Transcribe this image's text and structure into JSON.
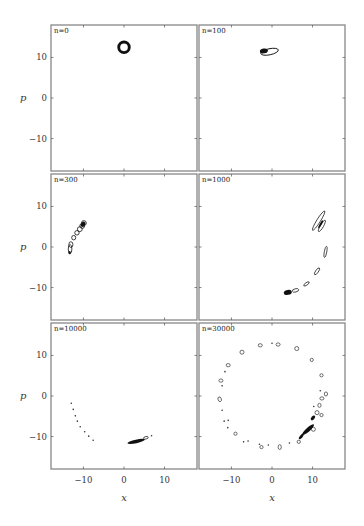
{
  "chart_data": {
    "type": "scatter",
    "layout": "3x2 grid of phase-space panels",
    "xlabel": "x",
    "ylabel": "p",
    "xlim": [
      -18,
      18
    ],
    "ylim": [
      -18,
      18
    ],
    "xticks": [
      -10,
      0,
      10
    ],
    "yticks": [
      10,
      0,
      -10
    ],
    "xtick_labels": [
      "−10",
      "0",
      "10"
    ],
    "ytick_labels": [
      "10",
      "0",
      "−10"
    ],
    "grid": false,
    "legend": null,
    "panels": [
      {
        "label": "n = 0",
        "label_text": "n=0",
        "description": "single compact ring (annulus) centered near x=0, p=12.5",
        "rings": [
          {
            "x": 0,
            "p": 12.5,
            "rx": 1.3,
            "ry": 1.3,
            "angle": 0,
            "filled": false,
            "stroke": 1.1
          }
        ],
        "blobs": [],
        "dots": []
      },
      {
        "label": "n = 100",
        "label_text": "n=100",
        "description": "stretched dark contour blob near x=-1, p=11.5",
        "rings": [
          {
            "x": -0.6,
            "p": 11.4,
            "rx": 2.2,
            "ry": 0.75,
            "angle": 12,
            "filled": false,
            "stroke": 0.9
          }
        ],
        "blobs": [
          {
            "x": -2.0,
            "p": 11.6,
            "rx": 1.0,
            "ry": 0.6,
            "angle": 10
          }
        ],
        "dots": []
      },
      {
        "label": "n = 300",
        "label_text": "n=300",
        "description": "chain of small contour islands along an arc from (-13,-1) to (-9.5,6)",
        "rings": [
          {
            "x": -13.3,
            "p": -0.5,
            "rx": 0.45,
            "ry": 1.1,
            "angle": 0,
            "filled": false,
            "stroke": 0.8
          },
          {
            "x": -13.1,
            "p": 0.6,
            "rx": 0.5,
            "ry": 0.7,
            "angle": 0,
            "filled": false,
            "stroke": 0.8
          },
          {
            "x": -12.4,
            "p": 2.3,
            "rx": 0.5,
            "ry": 0.55,
            "angle": 0,
            "filled": false,
            "stroke": 0.8
          },
          {
            "x": -11.6,
            "p": 3.5,
            "rx": 0.55,
            "ry": 0.55,
            "angle": 0,
            "filled": false,
            "stroke": 0.8
          },
          {
            "x": -10.9,
            "p": 4.4,
            "rx": 0.6,
            "ry": 0.6,
            "angle": 0,
            "filled": false,
            "stroke": 0.8
          },
          {
            "x": -10.3,
            "p": 5.2,
            "rx": 0.6,
            "ry": 0.6,
            "angle": 0,
            "filled": false,
            "stroke": 0.8
          },
          {
            "x": -9.9,
            "p": 5.9,
            "rx": 0.6,
            "ry": 0.6,
            "angle": 0,
            "filled": false,
            "stroke": 0.8
          }
        ],
        "blobs": [
          {
            "x": -13.4,
            "p": -1.4,
            "rx": 0.3,
            "ry": 0.4,
            "angle": 0
          },
          {
            "x": -10.1,
            "p": 5.6,
            "rx": 0.5,
            "ry": 0.7,
            "angle": -35
          }
        ],
        "dots": []
      },
      {
        "label": "n = 1000",
        "label_text": "n=1000",
        "description": "elongated filaments along a circular arc of radius ~13, clustered dense blob near (4,-11)",
        "rings": [
          {
            "x": 11.5,
            "p": 6.5,
            "rx": 2.8,
            "ry": 0.45,
            "angle": 58,
            "filled": false,
            "stroke": 0.7
          },
          {
            "x": 12.3,
            "p": 5.2,
            "rx": 1.6,
            "ry": 0.4,
            "angle": 60,
            "filled": false,
            "stroke": 0.7
          },
          {
            "x": 13.2,
            "p": -1.2,
            "rx": 1.4,
            "ry": 0.3,
            "angle": 80,
            "filled": false,
            "stroke": 0.7
          },
          {
            "x": 11.1,
            "p": -6.0,
            "rx": 1.0,
            "ry": 0.35,
            "angle": 55,
            "filled": false,
            "stroke": 0.7
          },
          {
            "x": 8.5,
            "p": -9.1,
            "rx": 0.8,
            "ry": 0.3,
            "angle": 35,
            "filled": false,
            "stroke": 0.7
          },
          {
            "x": 5.8,
            "p": -10.7,
            "rx": 0.8,
            "ry": 0.4,
            "angle": 15,
            "filled": false,
            "stroke": 0.7
          }
        ],
        "blobs": [
          {
            "x": 3.9,
            "p": -11.2,
            "rx": 1.0,
            "ry": 0.6,
            "angle": 10
          },
          {
            "x": 12.0,
            "p": 5.6,
            "rx": 1.1,
            "ry": 0.25,
            "angle": 60
          }
        ],
        "dots": []
      },
      {
        "label": "n = 10000",
        "label_text": "n=10000",
        "description": "trail of tiny dots along arc on left, dense streak near (3,-11)",
        "rings": [
          {
            "x": 5.4,
            "p": -10.3,
            "rx": 0.6,
            "ry": 0.3,
            "angle": 15,
            "filled": false,
            "stroke": 0.7
          }
        ],
        "blobs": [
          {
            "x": 3.0,
            "p": -11.2,
            "rx": 2.2,
            "ry": 0.45,
            "angle": 12
          }
        ],
        "dots": [
          {
            "x": -13.0,
            "p": -1.8
          },
          {
            "x": -12.5,
            "p": -3.3
          },
          {
            "x": -12.0,
            "p": -4.9
          },
          {
            "x": -11.5,
            "p": -6.2
          },
          {
            "x": -10.8,
            "p": -7.6
          },
          {
            "x": -9.7,
            "p": -8.8
          },
          {
            "x": -8.7,
            "p": -9.9
          },
          {
            "x": -7.6,
            "p": -10.9
          },
          {
            "x": 6.8,
            "p": -9.8
          }
        ]
      },
      {
        "label": "n = 30000",
        "label_text": "n=30000",
        "description": "small islands distributed around a full circle of radius ~13, dense chain near (8,-8)",
        "rings": [
          {
            "x": -2.9,
            "p": 12.5,
            "rx": 0.5,
            "ry": 0.4,
            "angle": 0,
            "filled": false,
            "stroke": 0.6
          },
          {
            "x": 1.5,
            "p": 12.7,
            "rx": 0.5,
            "ry": 0.4,
            "angle": 0,
            "filled": false,
            "stroke": 0.6
          },
          {
            "x": 6.1,
            "p": 11.7,
            "rx": 0.5,
            "ry": 0.5,
            "angle": 0,
            "filled": false,
            "stroke": 0.6
          },
          {
            "x": -7.4,
            "p": 10.8,
            "rx": 0.5,
            "ry": 0.5,
            "angle": 0,
            "filled": false,
            "stroke": 0.6
          },
          {
            "x": 9.8,
            "p": 8.9,
            "rx": 0.4,
            "ry": 0.4,
            "angle": 0,
            "filled": false,
            "stroke": 0.6
          },
          {
            "x": -10.8,
            "p": 7.6,
            "rx": 0.5,
            "ry": 0.4,
            "angle": 0,
            "filled": false,
            "stroke": 0.6
          },
          {
            "x": 12.2,
            "p": 5.1,
            "rx": 0.4,
            "ry": 0.4,
            "angle": 0,
            "filled": false,
            "stroke": 0.6
          },
          {
            "x": -12.6,
            "p": 3.8,
            "rx": 0.5,
            "ry": 0.4,
            "angle": 0,
            "filled": false,
            "stroke": 0.6
          },
          {
            "x": 13.3,
            "p": 0.5,
            "rx": 0.4,
            "ry": 0.5,
            "angle": 0,
            "filled": false,
            "stroke": 0.6
          },
          {
            "x": 12.3,
            "p": -0.6,
            "rx": 0.5,
            "ry": 0.4,
            "angle": 0,
            "filled": false,
            "stroke": 0.6
          },
          {
            "x": -12.9,
            "p": -0.8,
            "rx": 0.4,
            "ry": 0.6,
            "angle": 20,
            "filled": false,
            "stroke": 0.6
          },
          {
            "x": 11.7,
            "p": -2.3,
            "rx": 0.4,
            "ry": 0.5,
            "angle": 0,
            "filled": false,
            "stroke": 0.6
          },
          {
            "x": 11.1,
            "p": -4.1,
            "rx": 0.5,
            "ry": 0.5,
            "angle": 0,
            "filled": false,
            "stroke": 0.6
          },
          {
            "x": 12.2,
            "p": -4.7,
            "rx": 0.4,
            "ry": 0.4,
            "angle": 0,
            "filled": false,
            "stroke": 0.6
          },
          {
            "x": 10.2,
            "p": -8.2,
            "rx": 0.5,
            "ry": 0.5,
            "angle": 0,
            "filled": false,
            "stroke": 0.6
          },
          {
            "x": -9.0,
            "p": -9.3,
            "rx": 0.4,
            "ry": 0.4,
            "angle": 0,
            "filled": false,
            "stroke": 0.6
          },
          {
            "x": -2.6,
            "p": -12.6,
            "rx": 0.4,
            "ry": 0.4,
            "angle": 0,
            "filled": false,
            "stroke": 0.6
          },
          {
            "x": 1.9,
            "p": -12.6,
            "rx": 0.4,
            "ry": 0.6,
            "angle": 0,
            "filled": false,
            "stroke": 0.6
          },
          {
            "x": 6.6,
            "p": -11.3,
            "rx": 0.4,
            "ry": 0.4,
            "angle": 0,
            "filled": false,
            "stroke": 0.6
          }
        ],
        "blobs": [
          {
            "x": 8.9,
            "p": -8.3,
            "rx": 1.9,
            "ry": 0.5,
            "angle": 42
          },
          {
            "x": 10.1,
            "p": -5.4,
            "rx": 0.7,
            "ry": 0.4,
            "angle": 50
          },
          {
            "x": 7.2,
            "p": -10.0,
            "rx": 0.8,
            "ry": 0.35,
            "angle": 50
          }
        ],
        "dots": [
          {
            "x": 0.0,
            "p": 13.0
          },
          {
            "x": -11.6,
            "p": 6.0
          },
          {
            "x": -12.3,
            "p": 2.5
          },
          {
            "x": -12.3,
            "p": -3.5
          },
          {
            "x": -11.8,
            "p": -6.2
          },
          {
            "x": -10.8,
            "p": -6.0
          },
          {
            "x": -10.9,
            "p": -7.8
          },
          {
            "x": -7.0,
            "p": -11.3
          },
          {
            "x": -5.9,
            "p": -11.1
          },
          {
            "x": -3.1,
            "p": -11.9
          },
          {
            "x": -0.9,
            "p": -12.1
          },
          {
            "x": 4.3,
            "p": -11.6
          },
          {
            "x": 11.9,
            "p": 1.3
          },
          {
            "x": 10.3,
            "p": -2.6
          }
        ]
      }
    ]
  },
  "figure": {
    "xlabel": "x",
    "ylabel": "p",
    "panel_labels": [
      "n=0",
      "n=100",
      "n=300",
      "n=1000",
      "n=10000",
      "n=30000"
    ],
    "tick_labels": {
      "x": [
        "−10",
        "0",
        "10"
      ],
      "y": [
        "10",
        "0",
        "−10"
      ]
    }
  },
  "layout": {
    "cols_x": [
      51,
      199
    ],
    "rows_y": [
      25,
      174,
      323
    ],
    "panel_w": 146,
    "panel_h": 146,
    "frame_color": "#888888",
    "ink_color": "#111111"
  }
}
